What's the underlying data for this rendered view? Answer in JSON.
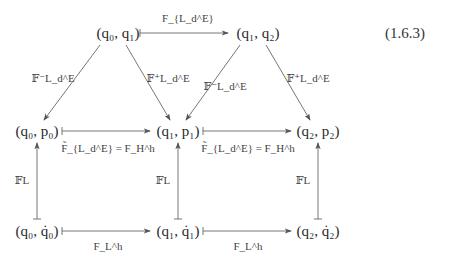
{
  "equation_number": "(1.6.3)",
  "nodes": {
    "q0q1": "(q₀, q₁)",
    "q1q2": "(q₁, q₂)",
    "q0p0": "(q₀, p₀)",
    "q1p1": "(q₁, p₁)",
    "q2p2": "(q₂, p₂)",
    "q0q0dot": "(q₀, q̇₀)",
    "q1q1dot": "(q₁, q̇₁)",
    "q2q2dot": "(q₂, q̇₂)"
  },
  "labels": {
    "top_map": "F_{L_d^E}",
    "fminus_left": "𝔽⁻L_d^E",
    "fplus_left": "𝔽⁺L_d^E",
    "fminus_right": "𝔽⁻L_d^E",
    "fplus_right": "𝔽⁺L_d^E",
    "mid_map_1": "F̃_{L_d^E} = F_H^h",
    "mid_map_2": "F̃_{L_d^E} = F_H^h",
    "legendre_1": "𝔽L",
    "legendre_2": "𝔽L",
    "legendre_3": "𝔽L",
    "bottom_map_1": "F_L^h",
    "bottom_map_2": "F_L^h"
  },
  "colors": {
    "line": "#555555",
    "text": "#2a2a2a"
  }
}
